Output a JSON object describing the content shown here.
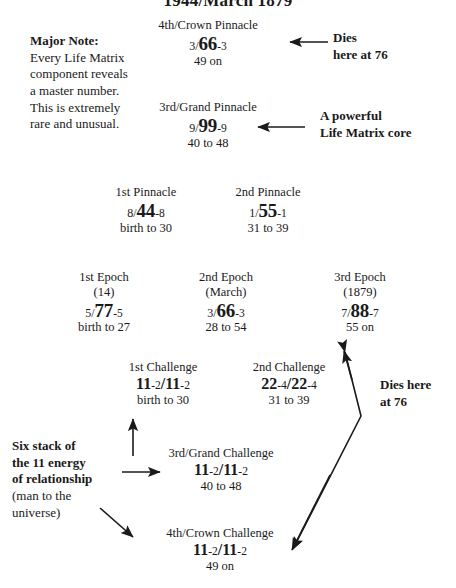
{
  "title": "1944/March 1879",
  "notes": {
    "major": {
      "heading": "Major Note:",
      "line1": "Every Life Matrix",
      "line2": "component reveals",
      "line3": "a master number.",
      "line4": "This is extremely",
      "line5": "rare and unusual."
    },
    "dies_top": {
      "line1": "Dies",
      "line2": "here at 76"
    },
    "core": {
      "line1": "A powerful",
      "line2": "Life Matrix core"
    },
    "dies_side": {
      "line1": "Dies here",
      "line2": "at 76"
    },
    "six_stack": {
      "line1": "Six stack of",
      "line2": "the 11 energy",
      "line3": "of relationship",
      "line4": "(man to the",
      "line5": "universe)"
    }
  },
  "pinnacles": [
    {
      "id": "pinnacle-4",
      "header": "4th/Crown Pinnacle",
      "prefix": "3/",
      "master": "66",
      "suffix": "-3",
      "range": "49 on"
    },
    {
      "id": "pinnacle-3",
      "header": "3rd/Grand Pinnacle",
      "prefix": "9/",
      "master": "99",
      "suffix": "-9",
      "range": "40 to 48"
    },
    {
      "id": "pinnacle-1",
      "header": "1st Pinnacle",
      "prefix": "8/",
      "master": "44",
      "suffix": "-8",
      "range": "birth to 30"
    },
    {
      "id": "pinnacle-2",
      "header": "2nd Pinnacle",
      "prefix": "1/",
      "master": "55",
      "suffix": "-1",
      "range": "31 to 39"
    }
  ],
  "epochs": [
    {
      "id": "epoch-1",
      "header": "1st Epoch",
      "sub": "(14)",
      "prefix": "5/",
      "master": "77",
      "suffix": "-5",
      "range": "birth to 27"
    },
    {
      "id": "epoch-2",
      "header": "2nd Epoch",
      "sub": "(March)",
      "prefix": "3/",
      "master": "66",
      "suffix": "-3",
      "range": "28 to 54"
    },
    {
      "id": "epoch-3",
      "header": "3rd Epoch",
      "sub": "(1879)",
      "prefix": "7/",
      "master": "88",
      "suffix": "-7",
      "range": "55 on"
    }
  ],
  "challenges": [
    {
      "id": "challenge-1",
      "header": "1st Challenge",
      "left_master": "11",
      "left_suffix": "-2",
      "sep": "/",
      "right_master": "11",
      "right_suffix": "-2",
      "range": "birth to 30"
    },
    {
      "id": "challenge-2",
      "header": "2nd Challenge",
      "left_master": "22",
      "left_suffix": "-4",
      "sep": "/",
      "right_master": "22",
      "right_suffix": "-4",
      "range": "31 to 39"
    },
    {
      "id": "challenge-3",
      "header": "3rd/Grand Challenge",
      "left_master": "11",
      "left_suffix": "-2",
      "sep": "/",
      "right_master": "11",
      "right_suffix": "-2",
      "range": "40 to 48"
    },
    {
      "id": "challenge-4",
      "header": "4th/Crown  Challenge",
      "left_master": "11",
      "left_suffix": "-2",
      "sep": "/",
      "right_master": "11",
      "right_suffix": "-2",
      "range": "49 on"
    }
  ],
  "colors": {
    "ink": "#1a1a1a",
    "background": "#ffffff"
  }
}
